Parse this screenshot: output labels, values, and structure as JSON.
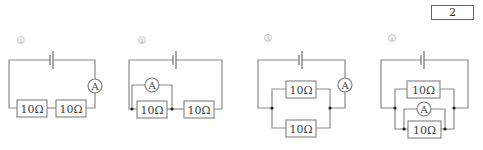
{
  "answer_box": {
    "value": "2"
  },
  "labels": {
    "resistor": "10Ω",
    "ammeter": "A"
  },
  "circuits": [
    {
      "number": "①",
      "description": "Two 10Ω resistors in series with ammeter"
    },
    {
      "number": "②",
      "description": "Ammeter in parallel with first 10Ω resistor, then in series with second 10Ω resistor"
    },
    {
      "number": "③",
      "description": "Two 10Ω resistors in parallel, ammeter in main branch"
    },
    {
      "number": "④",
      "description": "Two 10Ω resistors in parallel, ammeter in parallel with lower resistor"
    }
  ],
  "colors": {
    "wire": "#8a8a8a",
    "text": "#444444",
    "junction": "#222222"
  }
}
